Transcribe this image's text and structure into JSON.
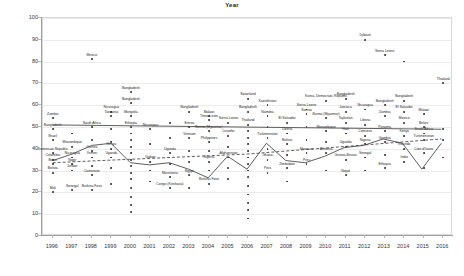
{
  "chart_data": {
    "type": "scatter",
    "title": "Year",
    "xlabel": "Year",
    "ylabel": "ORS Coverage",
    "xlim": [
      1995.5,
      2016.5
    ],
    "ylim": [
      0,
      100
    ],
    "grid": true,
    "legend": "none",
    "ytick_labels": [
      "0",
      "10",
      "20",
      "30",
      "40",
      "50",
      "60",
      "70",
      "80",
      "90",
      "100"
    ],
    "ytick_values": [
      0,
      10,
      20,
      30,
      40,
      50,
      60,
      70,
      80,
      90,
      100
    ],
    "xtick_labels": [
      "1996",
      "1997",
      "1998",
      "1999",
      "2000",
      "2001",
      "2002",
      "2003",
      "2004",
      "2005",
      "2006",
      "2007",
      "2008",
      "2009",
      "2010",
      "2011",
      "2012",
      "2013",
      "2014",
      "2015",
      "2016"
    ],
    "point_color": "#2b2b2b",
    "line_color": "#4a4a4a",
    "reference_line_value": 50,
    "series": [
      {
        "name": "ORS coverage by country-year",
        "points": [
          {
            "x": 1996,
            "y": 54,
            "label": "Zambia"
          },
          {
            "x": 1996,
            "y": 49,
            "label": "Bangladesh"
          },
          {
            "x": 1996,
            "y": 44,
            "label": "Brazil"
          },
          {
            "x": 1996,
            "y": 38,
            "label": "Dominican Republic"
          },
          {
            "x": 1996,
            "y": 35,
            "label": "Colombia"
          },
          {
            "x": 1996,
            "y": 33,
            "label": "Benin"
          },
          {
            "x": 1996,
            "y": 29,
            "label": "Bolivia"
          },
          {
            "x": 1996,
            "y": 20,
            "label": "Mali"
          },
          {
            "x": 1997,
            "y": 47,
            "label": ""
          },
          {
            "x": 1997,
            "y": 41,
            "label": "Mozambique"
          },
          {
            "x": 1997,
            "y": 36,
            "label": "Nicaragua"
          },
          {
            "x": 1997,
            "y": 33,
            "label": "Niger"
          },
          {
            "x": 1997,
            "y": 30,
            "label": "Jordan"
          },
          {
            "x": 1997,
            "y": 21,
            "label": "Senegal"
          },
          {
            "x": 1998,
            "y": 81,
            "label": "Mexico"
          },
          {
            "x": 1998,
            "y": 50,
            "label": "South Africa"
          },
          {
            "x": 1998,
            "y": 44,
            "label": ""
          },
          {
            "x": 1998,
            "y": 39,
            "label": "Guinea"
          },
          {
            "x": 1998,
            "y": 36,
            "label": "Yemen"
          },
          {
            "x": 1998,
            "y": 32,
            "label": ""
          },
          {
            "x": 1998,
            "y": 28,
            "label": "Cameroon"
          },
          {
            "x": 1998,
            "y": 21,
            "label": "Burkina Faso"
          },
          {
            "x": 1999,
            "y": 57,
            "label": "Nicaragua"
          },
          {
            "x": 1999,
            "y": 55,
            "label": "Tanzania"
          },
          {
            "x": 1999,
            "y": 49,
            "label": ""
          },
          {
            "x": 1999,
            "y": 43,
            "label": ""
          },
          {
            "x": 1999,
            "y": 40,
            "label": "Kenya"
          },
          {
            "x": 1999,
            "y": 36,
            "label": "Uganda"
          },
          {
            "x": 1999,
            "y": 31,
            "label": ""
          },
          {
            "x": 1999,
            "y": 24,
            "label": ""
          },
          {
            "x": 2000,
            "y": 66,
            "label": "Bangladesh"
          },
          {
            "x": 2000,
            "y": 61,
            "label": "Bangladesh"
          },
          {
            "x": 2000,
            "y": 55,
            "label": "Mongolia"
          },
          {
            "x": 2000,
            "y": 50,
            "label": "Ethiopia"
          },
          {
            "x": 2000,
            "y": 47,
            "label": ""
          },
          {
            "x": 2000,
            "y": 44,
            "label": ""
          },
          {
            "x": 2000,
            "y": 41,
            "label": ""
          },
          {
            "x": 2000,
            "y": 38,
            "label": ""
          },
          {
            "x": 2000,
            "y": 35,
            "label": ""
          },
          {
            "x": 2000,
            "y": 32,
            "label": ""
          },
          {
            "x": 2000,
            "y": 29,
            "label": ""
          },
          {
            "x": 2000,
            "y": 26,
            "label": ""
          },
          {
            "x": 2000,
            "y": 22,
            "label": ""
          },
          {
            "x": 2000,
            "y": 18,
            "label": ""
          },
          {
            "x": 2000,
            "y": 14,
            "label": ""
          },
          {
            "x": 2000,
            "y": 11,
            "label": ""
          },
          {
            "x": 2001,
            "y": 49,
            "label": "Nicaragua"
          },
          {
            "x": 2001,
            "y": 42,
            "label": ""
          },
          {
            "x": 2001,
            "y": 34,
            "label": "Gabon"
          },
          {
            "x": 2001,
            "y": 30,
            "label": ""
          },
          {
            "x": 2001,
            "y": 25,
            "label": ""
          },
          {
            "x": 2002,
            "y": 52,
            "label": ""
          },
          {
            "x": 2002,
            "y": 45,
            "label": ""
          },
          {
            "x": 2002,
            "y": 38,
            "label": "Uganda"
          },
          {
            "x": 2002,
            "y": 33,
            "label": ""
          },
          {
            "x": 2002,
            "y": 27,
            "label": "Mauritania"
          },
          {
            "x": 2002,
            "y": 22,
            "label": "Congo (Kinshasa)"
          },
          {
            "x": 2003,
            "y": 57,
            "label": "Bangladesh"
          },
          {
            "x": 2003,
            "y": 50,
            "label": "Eritrea"
          },
          {
            "x": 2003,
            "y": 45,
            "label": "Vietnam"
          },
          {
            "x": 2003,
            "y": 39,
            "label": ""
          },
          {
            "x": 2003,
            "y": 34,
            "label": ""
          },
          {
            "x": 2003,
            "y": 28,
            "label": "Egypt"
          },
          {
            "x": 2003,
            "y": 22,
            "label": ""
          },
          {
            "x": 2004,
            "y": 53,
            "label": "Timor-Leste"
          },
          {
            "x": 2004,
            "y": 55,
            "label": "Malawi"
          },
          {
            "x": 2004,
            "y": 48,
            "label": "Burma (Myanmar)"
          },
          {
            "x": 2004,
            "y": 43,
            "label": "Philippines"
          },
          {
            "x": 2004,
            "y": 39,
            "label": ""
          },
          {
            "x": 2004,
            "y": 34,
            "label": "Nigeria"
          },
          {
            "x": 2004,
            "y": 30,
            "label": ""
          },
          {
            "x": 2004,
            "y": 24,
            "label": "Burkina Faso"
          },
          {
            "x": 2005,
            "y": 52,
            "label": "Sierra Leone"
          },
          {
            "x": 2005,
            "y": 46,
            "label": "Lesotho"
          },
          {
            "x": 2005,
            "y": 41,
            "label": ""
          },
          {
            "x": 2005,
            "y": 36,
            "label": "Afghanistan"
          },
          {
            "x": 2005,
            "y": 31,
            "label": ""
          },
          {
            "x": 2005,
            "y": 26,
            "label": ""
          },
          {
            "x": 2006,
            "y": 63,
            "label": "Swaziland"
          },
          {
            "x": 2006,
            "y": 57,
            "label": "Bangladesh"
          },
          {
            "x": 2006,
            "y": 51,
            "label": "Thailand"
          },
          {
            "x": 2006,
            "y": 48,
            "label": ""
          },
          {
            "x": 2006,
            "y": 45,
            "label": ""
          },
          {
            "x": 2006,
            "y": 42,
            "label": ""
          },
          {
            "x": 2006,
            "y": 39,
            "label": ""
          },
          {
            "x": 2006,
            "y": 36,
            "label": ""
          },
          {
            "x": 2006,
            "y": 33,
            "label": ""
          },
          {
            "x": 2006,
            "y": 30,
            "label": ""
          },
          {
            "x": 2006,
            "y": 27,
            "label": ""
          },
          {
            "x": 2006,
            "y": 23,
            "label": ""
          },
          {
            "x": 2006,
            "y": 19,
            "label": ""
          },
          {
            "x": 2006,
            "y": 15,
            "label": ""
          },
          {
            "x": 2006,
            "y": 12,
            "label": ""
          },
          {
            "x": 2006,
            "y": 8,
            "label": ""
          },
          {
            "x": 2007,
            "y": 60,
            "label": "Kazakhstan"
          },
          {
            "x": 2007,
            "y": 55,
            "label": "Namibia"
          },
          {
            "x": 2007,
            "y": 50,
            "label": ""
          },
          {
            "x": 2007,
            "y": 45,
            "label": "Turkmenistan"
          },
          {
            "x": 2007,
            "y": 40,
            "label": ""
          },
          {
            "x": 2007,
            "y": 35,
            "label": "Ghana"
          },
          {
            "x": 2007,
            "y": 29,
            "label": "Peru"
          },
          {
            "x": 2008,
            "y": 52,
            "label": "El Salvador"
          },
          {
            "x": 2008,
            "y": 47,
            "label": "Liberia"
          },
          {
            "x": 2008,
            "y": 42,
            "label": "Bolivia"
          },
          {
            "x": 2008,
            "y": 37,
            "label": ""
          },
          {
            "x": 2008,
            "y": 31,
            "label": "Zimbabwe"
          },
          {
            "x": 2008,
            "y": 25,
            "label": ""
          },
          {
            "x": 2009,
            "y": 58,
            "label": "Sierra Leone"
          },
          {
            "x": 2009,
            "y": 56,
            "label": "Samoa"
          },
          {
            "x": 2009,
            "y": 50,
            "label": ""
          },
          {
            "x": 2009,
            "y": 44,
            "label": ""
          },
          {
            "x": 2009,
            "y": 38,
            "label": "Morocco"
          },
          {
            "x": 2009,
            "y": 33,
            "label": "Peru"
          },
          {
            "x": 2010,
            "y": 62,
            "label": "Korea, Democratic Republic"
          },
          {
            "x": 2010,
            "y": 54,
            "label": "Burma (Myanmar)"
          },
          {
            "x": 2010,
            "y": 48,
            "label": "Mozambique"
          },
          {
            "x": 2010,
            "y": 43,
            "label": ""
          },
          {
            "x": 2010,
            "y": 38,
            "label": "Armenia"
          },
          {
            "x": 2010,
            "y": 30,
            "label": ""
          },
          {
            "x": 2011,
            "y": 63,
            "label": "Bangladesh"
          },
          {
            "x": 2011,
            "y": 57,
            "label": "Jamaica"
          },
          {
            "x": 2011,
            "y": 52,
            "label": "Tajikistan"
          },
          {
            "x": 2011,
            "y": 47,
            "label": "Haiti"
          },
          {
            "x": 2011,
            "y": 41,
            "label": "Uganda"
          },
          {
            "x": 2011,
            "y": 35,
            "label": "Guinea-Bissau"
          },
          {
            "x": 2011,
            "y": 28,
            "label": "Nepal"
          },
          {
            "x": 2012,
            "y": 90,
            "label": "Djibouti"
          },
          {
            "x": 2012,
            "y": 58,
            "label": "Nicaragua"
          },
          {
            "x": 2012,
            "y": 51,
            "label": "Liberia"
          },
          {
            "x": 2012,
            "y": 46,
            "label": "Comoros"
          },
          {
            "x": 2012,
            "y": 42,
            "label": "Nigeria"
          },
          {
            "x": 2012,
            "y": 36,
            "label": "Senegal"
          },
          {
            "x": 2012,
            "y": 30,
            "label": ""
          },
          {
            "x": 2013,
            "y": 83,
            "label": "Sierra Leone"
          },
          {
            "x": 2013,
            "y": 60,
            "label": "Bangladesh"
          },
          {
            "x": 2013,
            "y": 55,
            "label": "Zambia"
          },
          {
            "x": 2013,
            "y": 48,
            "label": "Panama"
          },
          {
            "x": 2013,
            "y": 43,
            "label": "Gambia"
          },
          {
            "x": 2013,
            "y": 37,
            "label": ""
          },
          {
            "x": 2013,
            "y": 31,
            "label": "Ethiopia"
          },
          {
            "x": 2014,
            "y": 80,
            "label": ""
          },
          {
            "x": 2014,
            "y": 62,
            "label": "Bangladesh"
          },
          {
            "x": 2014,
            "y": 57,
            "label": "El Salvador"
          },
          {
            "x": 2014,
            "y": 52,
            "label": "Mexico"
          },
          {
            "x": 2014,
            "y": 46,
            "label": "Kenya"
          },
          {
            "x": 2014,
            "y": 40,
            "label": "Rwanda"
          },
          {
            "x": 2014,
            "y": 34,
            "label": "India"
          },
          {
            "x": 2015,
            "y": 56,
            "label": "Malawi"
          },
          {
            "x": 2015,
            "y": 50,
            "label": "Belize"
          },
          {
            "x": 2015,
            "y": 47,
            "label": "South Africa"
          },
          {
            "x": 2015,
            "y": 44,
            "label": "Turkmenistan"
          },
          {
            "x": 2015,
            "y": 38,
            "label": "Cote d'Ivoire"
          },
          {
            "x": 2015,
            "y": 31,
            "label": ""
          },
          {
            "x": 2016,
            "y": 70,
            "label": "Thailand"
          },
          {
            "x": 2016,
            "y": 49,
            "label": ""
          },
          {
            "x": 2016,
            "y": 44,
            "label": ""
          },
          {
            "x": 2016,
            "y": 36,
            "label": ""
          }
        ]
      }
    ],
    "trend_lines": [
      {
        "name": "reference-line",
        "style": "solid",
        "points": [
          {
            "x": 1996,
            "y": 50.5
          },
          {
            "x": 2006,
            "y": 49.5
          },
          {
            "x": 2016,
            "y": 48.5
          }
        ]
      },
      {
        "name": "mean-trend-line",
        "style": "solid",
        "points": [
          {
            "x": 1996,
            "y": 34
          },
          {
            "x": 1997,
            "y": 37
          },
          {
            "x": 1998,
            "y": 41
          },
          {
            "x": 1999,
            "y": 42
          },
          {
            "x": 2000,
            "y": 33
          },
          {
            "x": 2001,
            "y": 32
          },
          {
            "x": 2002,
            "y": 33
          },
          {
            "x": 2003,
            "y": 30
          },
          {
            "x": 2004,
            "y": 26
          },
          {
            "x": 2005,
            "y": 36
          },
          {
            "x": 2006,
            "y": 30
          },
          {
            "x": 2007,
            "y": 42
          },
          {
            "x": 2008,
            "y": 34
          },
          {
            "x": 2009,
            "y": 33
          },
          {
            "x": 2010,
            "y": 36
          },
          {
            "x": 2011,
            "y": 40
          },
          {
            "x": 2012,
            "y": 41
          },
          {
            "x": 2013,
            "y": 44
          },
          {
            "x": 2014,
            "y": 42
          },
          {
            "x": 2015,
            "y": 30
          },
          {
            "x": 2016,
            "y": 42
          }
        ]
      },
      {
        "name": "linear-fit-dashed",
        "style": "dashed",
        "points": [
          {
            "x": 1996,
            "y": 33
          },
          {
            "x": 2006,
            "y": 37
          },
          {
            "x": 2016,
            "y": 44
          }
        ]
      }
    ]
  }
}
